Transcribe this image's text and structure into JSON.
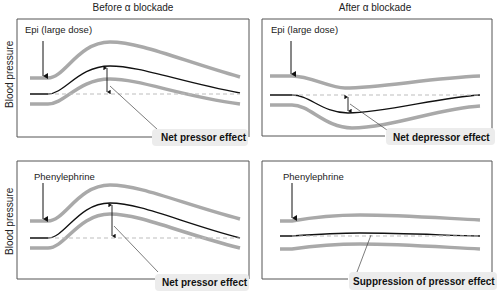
{
  "columns": [
    {
      "title": "Before α blockade"
    },
    {
      "title": "After α blockade"
    }
  ],
  "rows": [
    {
      "ylabel": "Blood pressure"
    },
    {
      "ylabel": "Blood pressure"
    }
  ],
  "panels": [
    {
      "drug": "Epi (large dose)",
      "effect": "Net pressor effect"
    },
    {
      "drug": "Epi (large dose)",
      "effect": "Net depressor effect"
    },
    {
      "drug": "Phenylephrine",
      "effect": "Net pressor effect"
    },
    {
      "drug": "Phenylephrine",
      "effect": "Suppression of pressor effect"
    }
  ],
  "colors": {
    "gray_curve": "#a9a9a9",
    "net_curve": "#111111",
    "baseline": "#bdbdbd",
    "frame": "#555555"
  }
}
